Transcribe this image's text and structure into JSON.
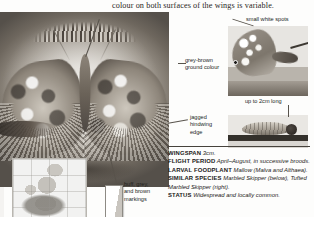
{
  "page": {
    "intro_text": "colour on both surfaces of the wings is variable."
  },
  "figures": {
    "main_photo": "mallow-skipper-specimen-photo",
    "distribution_map": "europe-distribution-map-inset",
    "scale_figure": "book-scale-comparison-figure",
    "side_photo": "butterfly-underside-side-view-photo",
    "caterpillar_photo": "caterpillar-on-branch-photo"
  },
  "callouts": [
    {
      "name": "small-white-spots",
      "text": "small white spots"
    },
    {
      "name": "grey-brown-ground-colour",
      "text": "grey-brown\nground colour"
    },
    {
      "name": "up-to-2cm-long",
      "text": "up to 2cm long"
    },
    {
      "name": "jagged-hindwing-edge",
      "text": "jagged\nhindwing\nedge"
    },
    {
      "name": "buff-grey-brown-markings",
      "text": "buff, grey,\nand brown\nmarkings"
    }
  ],
  "facts": [
    {
      "label": "WINGSPAN",
      "value": "3cm."
    },
    {
      "label": "FLIGHT PERIOD",
      "value": "April–August, in successive broods."
    },
    {
      "label": "LARVAL FOODPLANT",
      "value": "Mallow (Malva and Althaea)."
    },
    {
      "label": "SIMILAR SPECIES",
      "value": "Marbled Skipper (below), Tufted Marbled Skipper (right)."
    },
    {
      "label": "STATUS",
      "value": "Widespread and locally common."
    }
  ]
}
